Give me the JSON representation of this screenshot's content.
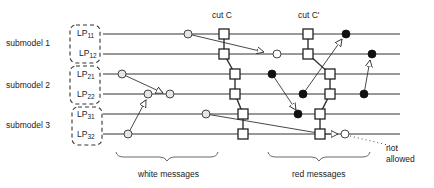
{
  "submodels": [
    {
      "label": "submodel 1",
      "processes": [
        {
          "base": "LP",
          "sub": "11"
        },
        {
          "base": "LP",
          "sub": "12"
        }
      ]
    },
    {
      "label": "submodel 2",
      "processes": [
        {
          "base": "LP",
          "sub": "21"
        },
        {
          "base": "LP",
          "sub": "22"
        }
      ]
    },
    {
      "label": "submodel 3",
      "processes": [
        {
          "base": "LP",
          "sub": "31"
        },
        {
          "base": "LP",
          "sub": "32"
        }
      ]
    }
  ],
  "cuts": {
    "c": "cut C",
    "c_prime": "cut C'"
  },
  "annotations": {
    "white_messages": "white messages",
    "red_messages": "red messages",
    "not": "not",
    "allowed": "allowed"
  },
  "colors": {
    "line": "#333333",
    "white_node": "#e6e6e6",
    "red_node": "#111111",
    "box": "#ffffff"
  }
}
